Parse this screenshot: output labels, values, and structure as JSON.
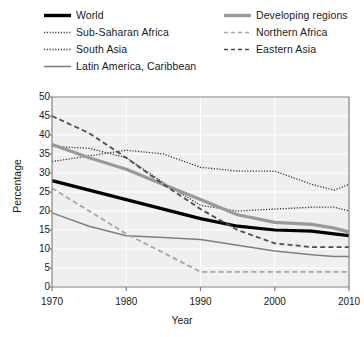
{
  "chart_data": {
    "type": "line",
    "title": "",
    "xlabel": "Year",
    "ylabel": "Percentage",
    "xlim": [
      1970,
      2010
    ],
    "ylim": [
      0,
      50
    ],
    "xticks": [
      "1970",
      "1980",
      "1990",
      "2000",
      "2010"
    ],
    "yticks": [
      "0",
      "5",
      "10",
      "15",
      "20",
      "25",
      "30",
      "35",
      "40",
      "45",
      "50"
    ],
    "grid": true,
    "legend_position": "above-plot",
    "x": [
      1970,
      1975,
      1980,
      1985,
      1990,
      1995,
      2000,
      2005,
      2008,
      2010
    ],
    "series": [
      {
        "name": "World",
        "style": "solid",
        "color": "#000000",
        "width": 3.2,
        "values": [
          28.0,
          25.5,
          23.0,
          20.5,
          18.0,
          16.0,
          15.0,
          14.7,
          14.0,
          13.5
        ]
      },
      {
        "name": "Sub-Saharan Africa",
        "style": "dotted",
        "color": "#333333",
        "width": 1.3,
        "values": [
          33.0,
          34.5,
          36.0,
          35.0,
          31.5,
          30.5,
          30.5,
          27.0,
          25.5,
          27.0
        ]
      },
      {
        "name": "South Asia",
        "style": "dotted",
        "color": "#333333",
        "width": 1.3,
        "values": [
          37.0,
          36.5,
          34.0,
          27.5,
          21.5,
          20.0,
          20.5,
          21.0,
          21.0,
          20.0
        ]
      },
      {
        "name": "Latin America, Caribbean",
        "style": "solid",
        "color": "#7f7f7f",
        "width": 1.5,
        "values": [
          19.5,
          16.0,
          13.5,
          13.0,
          12.5,
          11.0,
          9.5,
          8.5,
          8.0,
          8.0
        ]
      },
      {
        "name": "Developing regions",
        "style": "solid",
        "color": "#999999",
        "width": 3.2,
        "values": [
          37.5,
          34.0,
          31.0,
          27.0,
          23.0,
          19.0,
          17.0,
          16.5,
          15.5,
          14.5
        ]
      },
      {
        "name": "Northern Africa",
        "style": "dashed",
        "color": "#a6a6a6",
        "width": 1.8,
        "values": [
          26.0,
          20.0,
          14.0,
          9.0,
          4.0,
          4.0,
          4.0,
          4.0,
          4.0,
          4.0
        ]
      },
      {
        "name": "Eastern Asia",
        "style": "dashed",
        "color": "#4d4d4d",
        "width": 1.8,
        "values": [
          45.0,
          40.5,
          34.0,
          27.0,
          20.5,
          15.0,
          11.5,
          10.5,
          10.5,
          10.5
        ]
      }
    ]
  },
  "legend": {
    "items": [
      {
        "label": "World",
        "swatch": "solid-thick-black",
        "column": "a",
        "row": 0
      },
      {
        "label": "Sub-Saharan Africa",
        "swatch": "dotted-dark",
        "column": "a",
        "row": 1
      },
      {
        "label": "South Asia",
        "swatch": "dotted-dark",
        "column": "a",
        "row": 2
      },
      {
        "label": "Latin America, Caribbean",
        "swatch": "solid-thin-gray",
        "column": "a",
        "row": 3
      },
      {
        "label": "Developing regions",
        "swatch": "solid-thick-gray",
        "column": "b",
        "row": 0
      },
      {
        "label": "Northern Africa",
        "swatch": "dashed-light-gray",
        "column": "b",
        "row": 1
      },
      {
        "label": "Eastern Asia",
        "swatch": "dashed-dark-gray",
        "column": "b",
        "row": 2
      }
    ]
  },
  "colors": {
    "plot_background": "#efefef",
    "grid": "#ffffff",
    "axis": "#808080",
    "text": "#1a1a1a"
  }
}
